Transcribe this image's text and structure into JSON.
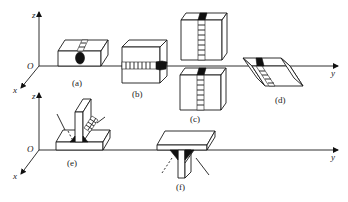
{
  "figure": {
    "axes": {
      "top": {
        "origin": "O",
        "x": "x",
        "y": "y",
        "z": "z"
      },
      "bottom": {
        "origin": "O",
        "x": "x",
        "y": "y",
        "z": "z"
      }
    },
    "panels": [
      {
        "id": "a",
        "label": "(a)",
        "description": "flat position butt weld"
      },
      {
        "id": "b",
        "label": "(b)",
        "description": "horizontal position butt weld"
      },
      {
        "id": "c",
        "label": "(c)",
        "description": "vertical position butt weld (upper and lower)"
      },
      {
        "id": "d",
        "label": "(d)",
        "description": "inclined position butt weld"
      },
      {
        "id": "e",
        "label": "(e)",
        "description": "T-joint fillet weld, flat/horizontal"
      },
      {
        "id": "f",
        "label": "(f)",
        "description": "T-joint fillet weld, overhead"
      }
    ]
  }
}
